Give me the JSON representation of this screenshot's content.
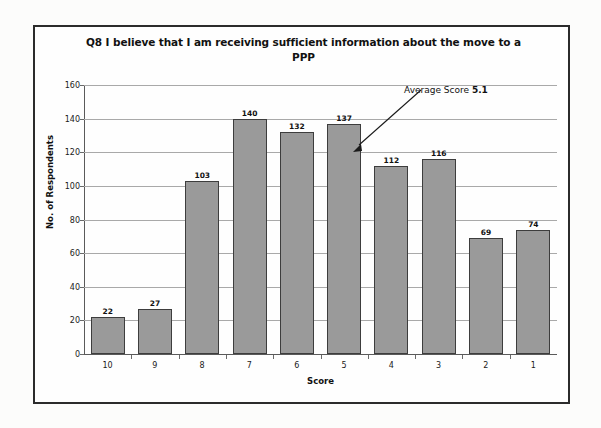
{
  "chart_data": {
    "type": "bar",
    "title": "Q8 I believe that I am receiving sufficient information about the move to a PPP",
    "xlabel": "Score",
    "ylabel": "No. of Respondents",
    "categories": [
      "10",
      "9",
      "8",
      "7",
      "6",
      "5",
      "4",
      "3",
      "2",
      "1"
    ],
    "values": [
      22,
      27,
      103,
      140,
      132,
      137,
      112,
      116,
      69,
      74
    ],
    "ylim": [
      0,
      160
    ],
    "ytick_labels": [
      "0",
      "20",
      "40",
      "60",
      "80",
      "100",
      "120",
      "140",
      "160"
    ],
    "ytick_values": [
      0,
      20,
      40,
      60,
      80,
      100,
      120,
      140,
      160
    ],
    "grid": true,
    "legend": "none",
    "bar_color": "#9a9a9a",
    "bar_border_color": "#3d3d3d",
    "gridline_color": "#a9a9a9",
    "annotations": [
      {
        "text_prefix": "Average Score ",
        "text_value": "5.1",
        "points_to_category": "5",
        "points_to_value": 137
      }
    ]
  }
}
